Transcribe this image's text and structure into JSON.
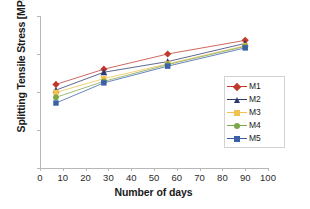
{
  "chart_data": {
    "type": "line",
    "title": "",
    "xlabel": "Number of days",
    "ylabel": "Splitting Tensile Stress [MPa]",
    "xlim": [
      0,
      100
    ],
    "ylim": [
      0,
      4
    ],
    "xticks": [
      0,
      10,
      20,
      30,
      40,
      50,
      60,
      70,
      80,
      90,
      100
    ],
    "yticks": [
      0,
      1,
      2,
      3,
      4
    ],
    "grid": false,
    "legend_position": "right",
    "x": [
      7,
      28,
      56,
      90
    ],
    "series": [
      {
        "name": "M1",
        "values": [
          2.2,
          2.6,
          3.0,
          3.36
        ],
        "color": "#C0392B",
        "marker": "diamond"
      },
      {
        "name": "M2",
        "values": [
          2.05,
          2.52,
          2.8,
          3.28
        ],
        "color": "#2E3A6E",
        "marker": "triangle"
      },
      {
        "name": "M3",
        "values": [
          1.99,
          2.35,
          2.74,
          3.22
        ],
        "color": "#F2C14E",
        "marker": "square"
      },
      {
        "name": "M4",
        "values": [
          1.86,
          2.28,
          2.72,
          3.2
        ],
        "color": "#7DA64B",
        "marker": "circle"
      },
      {
        "name": "M5",
        "values": [
          1.71,
          2.24,
          2.68,
          3.16
        ],
        "color": "#3A60A8",
        "marker": "square"
      }
    ]
  },
  "axes": {
    "y_tick_labels": [
      "0",
      "1",
      "2",
      "3",
      "4"
    ],
    "x_tick_labels": [
      "0",
      "10",
      "20",
      "30",
      "40",
      "50",
      "60",
      "70",
      "80",
      "90",
      "100"
    ],
    "x_title": "Number of days",
    "y_title": "Splitting Tensile Stress [MPa]"
  },
  "legend": {
    "items": [
      {
        "label": "M1"
      },
      {
        "label": "M2"
      },
      {
        "label": "M3"
      },
      {
        "label": "M4"
      },
      {
        "label": "M5"
      }
    ]
  }
}
